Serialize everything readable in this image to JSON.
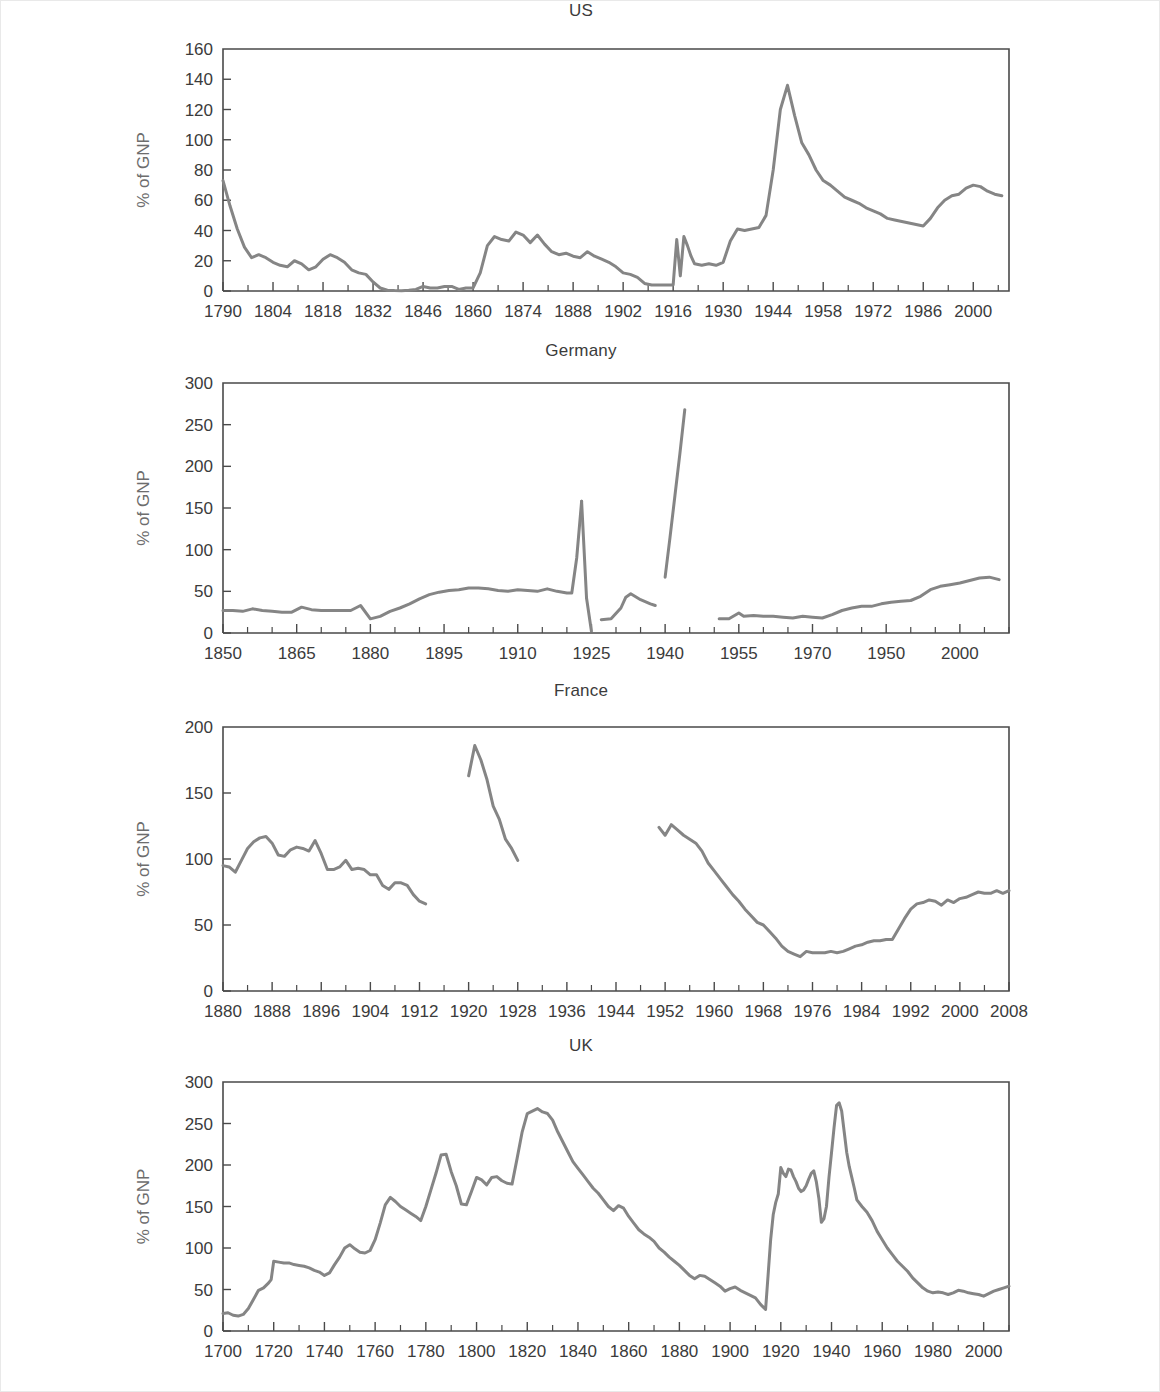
{
  "figure": {
    "background_color": "#ffffff",
    "line_color": "#858585",
    "axis_color": "#4a4a4a",
    "ylabel": "% of GNP"
  },
  "chart_data": [
    {
      "type": "line",
      "title": "US",
      "xlabel": "",
      "ylabel": "% of GNP",
      "xlim": [
        1790,
        2010
      ],
      "ylim": [
        0,
        160
      ],
      "yticks": [
        0,
        20,
        40,
        60,
        80,
        100,
        120,
        140,
        160
      ],
      "xticks": [
        1790,
        1804,
        1818,
        1832,
        1846,
        1860,
        1874,
        1888,
        1902,
        1916,
        1930,
        1944,
        1958,
        1972,
        1986,
        2000
      ],
      "xtick_minor_step": 7,
      "grid": false,
      "legend": "none",
      "x": [
        1790,
        1792,
        1794,
        1796,
        1798,
        1800,
        1802,
        1804,
        1806,
        1808,
        1810,
        1812,
        1814,
        1816,
        1818,
        1820,
        1822,
        1824,
        1826,
        1828,
        1830,
        1832,
        1834,
        1836,
        1838,
        1840,
        1842,
        1844,
        1846,
        1848,
        1850,
        1852,
        1854,
        1856,
        1858,
        1860,
        1862,
        1864,
        1866,
        1868,
        1870,
        1872,
        1874,
        1876,
        1878,
        1880,
        1882,
        1884,
        1886,
        1888,
        1890,
        1892,
        1894,
        1896,
        1898,
        1900,
        1902,
        1904,
        1906,
        1908,
        1910,
        1912,
        1914,
        1916,
        1917,
        1918,
        1919,
        1920,
        1921,
        1922,
        1924,
        1926,
        1928,
        1930,
        1932,
        1934,
        1936,
        1938,
        1940,
        1942,
        1944,
        1946,
        1948,
        1950,
        1952,
        1954,
        1956,
        1958,
        1960,
        1962,
        1964,
        1966,
        1968,
        1970,
        1972,
        1974,
        1976,
        1978,
        1980,
        1982,
        1984,
        1986,
        1988,
        1990,
        1992,
        1994,
        1996,
        1998,
        2000,
        2002,
        2004,
        2006,
        2008
      ],
      "y": [
        73,
        56,
        41,
        29,
        22,
        24,
        22,
        19,
        17,
        16,
        20,
        18,
        14,
        16,
        21,
        24,
        22,
        19,
        14,
        12,
        11,
        6,
        2,
        0.5,
        0.3,
        0.2,
        0.5,
        1,
        3,
        2,
        2,
        3,
        3,
        1,
        2,
        2,
        12,
        30,
        36,
        34,
        33,
        39,
        37,
        32,
        37,
        31,
        26,
        24,
        25,
        23,
        22,
        26,
        23,
        21,
        19,
        16,
        12,
        11,
        9,
        5,
        4,
        4,
        4,
        4,
        34,
        10,
        36,
        30,
        23,
        18,
        17,
        18,
        17,
        19,
        33,
        41,
        40,
        41,
        42,
        50,
        80,
        120,
        136,
        116,
        98,
        90,
        80,
        73,
        70,
        66,
        62,
        60,
        58,
        55,
        53,
        51,
        48,
        47,
        46,
        45,
        44,
        43,
        48,
        55,
        60,
        63,
        64,
        68,
        70,
        69,
        66,
        64,
        63,
        65,
        67
      ],
      "notes": "US federal debt as % of GNP, 1790-2008"
    },
    {
      "type": "line",
      "title": "Germany",
      "xlabel": "",
      "ylabel": "% of GNP",
      "xlim": [
        1850,
        2010
      ],
      "ylim": [
        0,
        300
      ],
      "yticks": [
        0,
        50,
        100,
        150,
        200,
        250,
        300
      ],
      "xticks": [
        1850,
        1865,
        1880,
        1895,
        1910,
        1925,
        1940,
        1955,
        1970,
        1950,
        2000
      ],
      "xtick_values": [
        1850,
        1865,
        1880,
        1895,
        1910,
        1925,
        1940,
        1955,
        1970,
        1985,
        2000
      ],
      "xtick_minor_step": 5,
      "grid": false,
      "legend": "none",
      "segments": [
        {
          "x": [
            1850,
            1852,
            1854,
            1856,
            1858,
            1860,
            1862,
            1864,
            1866,
            1868,
            1870,
            1872,
            1874,
            1876,
            1878,
            1880,
            1882,
            1884,
            1886,
            1888,
            1890,
            1892,
            1894,
            1896,
            1898,
            1900,
            1902,
            1904,
            1906,
            1908,
            1910,
            1912,
            1914,
            1916,
            1918,
            1920,
            1921,
            1922,
            1923
          ],
          "y": [
            27,
            27,
            26,
            29,
            27,
            26,
            25,
            25,
            31,
            28,
            27,
            27,
            27,
            27,
            33,
            17,
            20,
            26,
            30,
            35,
            41,
            46,
            49,
            51,
            52,
            54,
            54,
            53,
            51,
            50,
            52,
            51,
            50,
            53,
            50,
            48,
            48,
            90,
            158
          ]
        },
        {
          "x": [
            1923,
            1924
          ],
          "y": [
            158,
            42
          ]
        },
        {
          "x": [
            1924,
            1925
          ],
          "y": [
            42,
            2
          ]
        },
        {
          "x": [
            1927,
            1929,
            1931,
            1932,
            1933,
            1935,
            1937,
            1938
          ],
          "y": [
            16,
            17,
            30,
            43,
            47,
            40,
            35,
            33
          ]
        },
        {
          "x": [
            1940,
            1941,
            1942,
            1943,
            1944
          ],
          "y": [
            67,
            115,
            165,
            215,
            268
          ]
        },
        {
          "x": [
            1951,
            1953,
            1955,
            1956,
            1958,
            1960,
            1962,
            1964,
            1966,
            1968,
            1970,
            1972,
            1974,
            1976,
            1978,
            1980,
            1982,
            1984,
            1986,
            1988,
            1990,
            1992,
            1994,
            1996,
            1998,
            2000,
            2002,
            2004,
            2006,
            2008
          ],
          "y": [
            17,
            17,
            24,
            20,
            21,
            20,
            20,
            19,
            18,
            20,
            19,
            18,
            22,
            27,
            30,
            32,
            32,
            35,
            37,
            38,
            39,
            44,
            52,
            56,
            58,
            60,
            63,
            66,
            67,
            64
          ]
        }
      ],
      "notes": "German debt as % of GNP, 1850-2008, with gaps (hyperinflation, WWII, postwar)"
    },
    {
      "type": "line",
      "title": "France",
      "xlabel": "",
      "ylabel": "% of GNP",
      "xlim": [
        1880,
        2008
      ],
      "ylim": [
        0,
        200
      ],
      "yticks": [
        0,
        50,
        100,
        150,
        200
      ],
      "xticks": [
        1880,
        1888,
        1896,
        1904,
        1912,
        1920,
        1928,
        1936,
        1944,
        1952,
        1960,
        1968,
        1976,
        1984,
        1992,
        2000,
        2008
      ],
      "xtick_minor_step": 4,
      "grid": false,
      "legend": "none",
      "segments": [
        {
          "x": [
            1880,
            1881,
            1882,
            1883,
            1884,
            1885,
            1886,
            1887,
            1888,
            1889,
            1890,
            1891,
            1892,
            1893,
            1894,
            1895,
            1896,
            1897,
            1898,
            1899,
            1900,
            1901,
            1902,
            1903,
            1904,
            1905,
            1906,
            1907,
            1908,
            1909,
            1910,
            1911,
            1912,
            1913
          ],
          "y": [
            95,
            94,
            90,
            99,
            108,
            113,
            116,
            117,
            112,
            103,
            102,
            107,
            109,
            108,
            106,
            114,
            104,
            92,
            92,
            94,
            99,
            92,
            93,
            92,
            88,
            88,
            80,
            77,
            82,
            82,
            80,
            73,
            68,
            66
          ]
        },
        {
          "x": [
            1920,
            1921,
            1922,
            1923,
            1924,
            1925,
            1926,
            1927,
            1928
          ],
          "y": [
            163,
            186,
            175,
            160,
            140,
            130,
            115,
            108,
            99
          ]
        },
        {
          "x": [
            1951,
            1952,
            1953,
            1954,
            1955,
            1956,
            1957,
            1958,
            1959,
            1960,
            1961,
            1962,
            1963,
            1964,
            1965,
            1966,
            1967,
            1968,
            1969,
            1970,
            1971,
            1972,
            1973,
            1974,
            1975,
            1976,
            1977,
            1978,
            1979,
            1980,
            1981,
            1982,
            1983,
            1984,
            1985,
            1986,
            1987,
            1988,
            1989,
            1990,
            1991,
            1992,
            1993,
            1994,
            1995,
            1996,
            1997,
            1998,
            1999,
            2000,
            2001,
            2002,
            2003,
            2004,
            2005,
            2006,
            2007,
            2008
          ],
          "y": [
            124,
            118,
            126,
            122,
            118,
            115,
            112,
            106,
            97,
            91,
            85,
            79,
            73,
            68,
            62,
            57,
            52,
            50,
            45,
            40,
            34,
            30,
            28,
            26,
            30,
            29,
            29,
            29,
            30,
            29,
            30,
            32,
            34,
            35,
            37,
            38,
            38,
            39,
            39,
            47,
            55,
            62,
            66,
            67,
            69,
            68,
            65,
            69,
            67,
            70,
            71,
            73,
            75,
            74,
            74,
            76,
            74,
            76
          ]
        }
      ],
      "notes": "French debt as % of GNP, 1880-2008 with gaps for the world wars"
    },
    {
      "type": "line",
      "title": "UK",
      "xlabel": "",
      "ylabel": "% of GNP",
      "xlim": [
        1700,
        2010
      ],
      "ylim": [
        0,
        300
      ],
      "yticks": [
        0,
        50,
        100,
        150,
        200,
        250,
        300
      ],
      "xticks": [
        1700,
        1720,
        1740,
        1760,
        1780,
        1800,
        1820,
        1840,
        1860,
        1880,
        1900,
        1920,
        1940,
        1960,
        1980,
        2000
      ],
      "xtick_minor_step": 10,
      "grid": false,
      "legend": "none",
      "x": [
        1700,
        1702,
        1704,
        1706,
        1708,
        1710,
        1712,
        1714,
        1716,
        1718,
        1719,
        1720,
        1722,
        1724,
        1726,
        1728,
        1730,
        1732,
        1734,
        1736,
        1738,
        1740,
        1742,
        1744,
        1746,
        1748,
        1750,
        1752,
        1754,
        1756,
        1758,
        1760,
        1762,
        1764,
        1766,
        1768,
        1770,
        1772,
        1774,
        1776,
        1778,
        1780,
        1782,
        1784,
        1786,
        1788,
        1790,
        1792,
        1794,
        1796,
        1798,
        1800,
        1802,
        1804,
        1806,
        1808,
        1810,
        1812,
        1814,
        1816,
        1818,
        1820,
        1822,
        1824,
        1826,
        1828,
        1830,
        1832,
        1834,
        1836,
        1838,
        1840,
        1842,
        1844,
        1846,
        1848,
        1850,
        1852,
        1854,
        1856,
        1858,
        1860,
        1862,
        1864,
        1866,
        1868,
        1870,
        1872,
        1874,
        1876,
        1878,
        1880,
        1882,
        1884,
        1886,
        1888,
        1890,
        1892,
        1894,
        1896,
        1898,
        1900,
        1902,
        1904,
        1906,
        1908,
        1910,
        1912,
        1914,
        1915,
        1916,
        1917,
        1918,
        1919,
        1920,
        1921,
        1922,
        1923,
        1924,
        1925,
        1926,
        1927,
        1928,
        1929,
        1930,
        1931,
        1932,
        1933,
        1934,
        1935,
        1936,
        1937,
        1938,
        1939,
        1940,
        1941,
        1942,
        1943,
        1944,
        1945,
        1946,
        1947,
        1948,
        1949,
        1950,
        1952,
        1954,
        1956,
        1958,
        1960,
        1962,
        1964,
        1966,
        1968,
        1970,
        1972,
        1974,
        1976,
        1978,
        1980,
        1982,
        1984,
        1986,
        1988,
        1990,
        1992,
        1994,
        1996,
        1998,
        2000,
        2002,
        2004,
        2006,
        2008,
        2010
      ],
      "y": [
        21,
        22,
        19,
        18,
        20,
        27,
        38,
        49,
        52,
        58,
        62,
        84,
        83,
        82,
        82,
        80,
        79,
        78,
        76,
        73,
        71,
        67,
        70,
        80,
        89,
        100,
        104,
        99,
        95,
        94,
        97,
        110,
        130,
        152,
        161,
        156,
        150,
        146,
        142,
        138,
        133,
        150,
        170,
        190,
        212,
        213,
        192,
        175,
        153,
        152,
        168,
        185,
        182,
        176,
        185,
        186,
        181,
        178,
        177,
        208,
        240,
        262,
        265,
        268,
        264,
        262,
        254,
        240,
        228,
        216,
        204,
        196,
        188,
        180,
        172,
        166,
        158,
        150,
        145,
        151,
        148,
        138,
        130,
        122,
        117,
        113,
        108,
        100,
        95,
        89,
        84,
        79,
        73,
        67,
        63,
        67,
        66,
        62,
        58,
        54,
        48,
        51,
        53,
        49,
        46,
        43,
        40,
        32,
        26,
        68,
        110,
        140,
        155,
        165,
        197,
        190,
        186,
        195,
        194,
        186,
        180,
        172,
        168,
        170,
        175,
        183,
        190,
        193,
        180,
        160,
        131,
        135,
        150,
        185,
        215,
        245,
        272,
        275,
        265,
        240,
        215,
        198,
        185,
        172,
        158,
        150,
        143,
        133,
        120,
        110,
        100,
        92,
        84,
        78,
        72,
        64,
        58,
        52,
        48,
        46,
        47,
        46,
        44,
        46,
        49,
        48,
        46,
        45,
        44,
        42,
        45,
        48,
        50,
        52,
        54,
        57
      ],
      "notes": "UK national debt as % of GNP, 1700-2010"
    }
  ]
}
